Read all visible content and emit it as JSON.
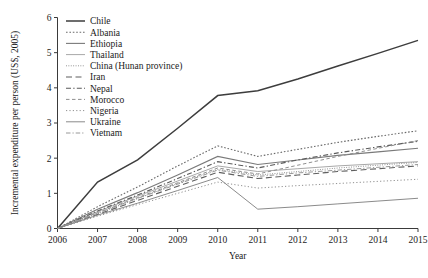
{
  "chart_data": {
    "type": "line",
    "title": "",
    "xlabel": "Year",
    "ylabel": "Incremental expenditure per person (US$, 2005)",
    "x": [
      2006,
      2007,
      2008,
      2009,
      2010,
      2011,
      2012,
      2013,
      2014,
      2015
    ],
    "xlim": [
      2006,
      2015
    ],
    "ylim": [
      0,
      6
    ],
    "xticks": [
      "2006",
      "2007",
      "2008",
      "2009",
      "2010",
      "2011",
      "2012",
      "2013",
      "2014",
      "2015"
    ],
    "yticks": [
      "0",
      "1",
      "2",
      "3",
      "4",
      "5",
      "6"
    ],
    "grid": false,
    "legend_position": "upper left inside",
    "series": [
      {
        "name": "Chile",
        "style": "solid",
        "color": "#3d3d3d",
        "width": 1.5,
        "dash": "none",
        "values": [
          0,
          1.32,
          1.95,
          2.85,
          3.78,
          3.92,
          4.25,
          4.62,
          4.98,
          5.35
        ]
      },
      {
        "name": "Albania",
        "style": "dotted",
        "color": "#6a6a6a",
        "width": 1.1,
        "dash": "1.6,1.8",
        "values": [
          0,
          0.62,
          1.18,
          1.78,
          2.35,
          2.05,
          2.25,
          2.45,
          2.62,
          2.78
        ]
      },
      {
        "name": "Ethiopia",
        "style": "solid",
        "color": "#7a7a7a",
        "width": 1.1,
        "dash": "none",
        "values": [
          0,
          0.55,
          1.02,
          1.52,
          2.05,
          1.82,
          1.95,
          2.08,
          2.18,
          2.28
        ]
      },
      {
        "name": "Thailand",
        "style": "solid-light",
        "color": "#a8a8a8",
        "width": 1.0,
        "dash": "none",
        "values": [
          0,
          0.48,
          0.92,
          1.35,
          1.78,
          1.62,
          1.7,
          1.78,
          1.84,
          1.9
        ]
      },
      {
        "name": "China (Hunan province)",
        "style": "fine-dotted",
        "color": "#8a8a8a",
        "width": 1.0,
        "dash": "0.9,1.5",
        "values": [
          0,
          0.42,
          0.85,
          1.28,
          1.68,
          1.52,
          1.62,
          1.72,
          1.8,
          1.88
        ]
      },
      {
        "name": "Iran",
        "style": "dashed",
        "color": "#5f5f5f",
        "width": 1.1,
        "dash": "6,3.5",
        "values": [
          0,
          0.4,
          0.8,
          1.2,
          1.6,
          1.42,
          1.52,
          1.62,
          1.7,
          1.78
        ]
      },
      {
        "name": "Nepal",
        "style": "dash-dot",
        "color": "#5a5a5a",
        "width": 1.1,
        "dash": "5,2.2,1.4,2.2",
        "values": [
          0,
          0.5,
          0.95,
          1.42,
          1.9,
          1.72,
          1.95,
          2.15,
          2.32,
          2.48
        ]
      },
      {
        "name": "Morocco",
        "style": "long-dash",
        "color": "#8f8f8f",
        "width": 1.0,
        "dash": "3.5,2.5",
        "values": [
          0,
          0.45,
          0.88,
          1.3,
          1.72,
          1.55,
          1.8,
          2.05,
          2.28,
          2.5
        ]
      },
      {
        "name": "Nigeria",
        "style": "dotted-sparse",
        "color": "#909090",
        "width": 1.0,
        "dash": "1.2,2.2",
        "values": [
          0,
          0.35,
          0.68,
          1.0,
          1.32,
          1.15,
          1.22,
          1.28,
          1.34,
          1.4
        ]
      },
      {
        "name": "Ukraine",
        "style": "solid-thin",
        "color": "#8b8b8b",
        "width": 1.0,
        "dash": "none",
        "values": [
          0,
          0.38,
          0.72,
          1.08,
          1.45,
          0.55,
          0.62,
          0.7,
          0.78,
          0.86
        ]
      },
      {
        "name": "Vietnam",
        "style": "dash-dot-light",
        "color": "#989898",
        "width": 1.0,
        "dash": "4.5,2,1.2,2",
        "values": [
          0,
          0.44,
          0.86,
          1.26,
          1.66,
          1.48,
          1.58,
          1.66,
          1.74,
          1.82
        ]
      }
    ]
  }
}
